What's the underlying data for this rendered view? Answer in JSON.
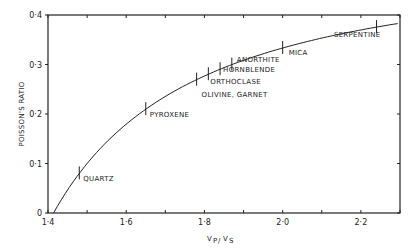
{
  "chart_data": {
    "type": "line",
    "title": "",
    "xlabel": "VP/VS",
    "ylabel": "POISSON'S RATIO",
    "xlim": [
      1.4,
      2.3
    ],
    "ylim": [
      0,
      0.4
    ],
    "grid": false,
    "x_ticks": [
      "1·4",
      "1·6",
      "1·8",
      "2·0",
      "2·2"
    ],
    "y_ticks": [
      "0",
      "0·1",
      "0·2",
      "0·3",
      "0·4"
    ],
    "curve": {
      "name": "Poisson's ratio vs Vp/Vs",
      "x": [
        1.414,
        1.45,
        1.5,
        1.55,
        1.6,
        1.65,
        1.7,
        1.75,
        1.8,
        1.85,
        1.9,
        2.0,
        2.1,
        2.2,
        2.3
      ],
      "y": [
        0.0,
        0.047,
        0.1,
        0.143,
        0.179,
        0.21,
        0.236,
        0.258,
        0.277,
        0.294,
        0.308,
        0.333,
        0.353,
        0.37,
        0.383
      ]
    },
    "annotations": [
      {
        "label": "QUARTZ",
        "x": 1.48,
        "y": 0.08
      },
      {
        "label": "PYROXENE",
        "x": 1.65,
        "y": 0.21
      },
      {
        "label": "OLIVINE, GARNET",
        "x": 1.78,
        "y": 0.27
      },
      {
        "label": "ORTHOCLASE",
        "x": 1.81,
        "y": 0.28
      },
      {
        "label": "HORNBLENDE",
        "x": 1.84,
        "y": 0.29
      },
      {
        "label": "ANORTHITE",
        "x": 1.87,
        "y": 0.3
      },
      {
        "label": "MICA",
        "x": 2.0,
        "y": 0.333
      },
      {
        "label": "SERPENTINE",
        "x": 2.24,
        "y": 0.376
      }
    ]
  }
}
